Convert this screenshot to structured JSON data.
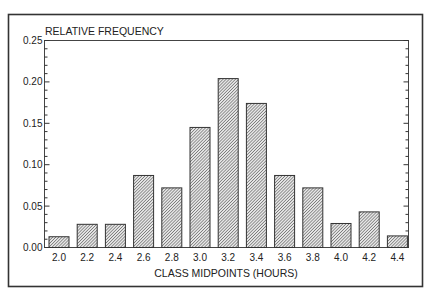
{
  "chart_data": {
    "type": "bar",
    "title": "",
    "ylabel": "RELATIVE FREQUENCY",
    "xlabel": "CLASS MIDPOINTS (HOURS)",
    "categories": [
      "2.0",
      "2.2",
      "2.4",
      "2.6",
      "2.8",
      "3.0",
      "3.2",
      "3.4",
      "3.6",
      "3.8",
      "4.0",
      "4.2",
      "4.4"
    ],
    "values": [
      0.013,
      0.028,
      0.028,
      0.087,
      0.072,
      0.145,
      0.204,
      0.174,
      0.087,
      0.072,
      0.029,
      0.043,
      0.014
    ],
    "ylim": [
      0,
      0.25
    ],
    "yticks": [
      "0.00",
      "0.05",
      "0.10",
      "0.15",
      "0.20",
      "0.25"
    ],
    "ytick_values": [
      0,
      0.05,
      0.1,
      0.15,
      0.2,
      0.25
    ],
    "minor_ytick_step": 0.01,
    "grid": false,
    "legend": null,
    "bar_style": "diagonal-hatch",
    "colors": {
      "frame": "#333333",
      "axis": "#222222",
      "hatch": "#555555",
      "bar_border": "#333333",
      "background": "#ffffff"
    }
  }
}
